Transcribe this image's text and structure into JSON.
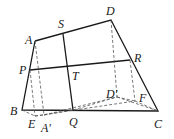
{
  "diagram": {
    "type": "geometry-figure",
    "points": {
      "A": {
        "label": "A",
        "x": 35,
        "y": 41,
        "lx": 25,
        "ly": 44
      },
      "S": {
        "label": "S",
        "x": 63,
        "y": 34,
        "lx": 58,
        "ly": 28
      },
      "D": {
        "label": "D",
        "x": 111,
        "y": 20,
        "lx": 106,
        "ly": 15
      },
      "P": {
        "label": "P",
        "x": 30,
        "y": 70,
        "lx": 19,
        "ly": 74
      },
      "T": {
        "label": "T",
        "x": 68,
        "y": 69,
        "lx": 72,
        "ly": 80
      },
      "R": {
        "label": "R",
        "x": 130,
        "y": 60,
        "lx": 134,
        "ly": 62
      },
      "B": {
        "label": "B",
        "x": 22,
        "y": 110,
        "lx": 10,
        "ly": 115
      },
      "Q": {
        "label": "Q",
        "x": 73,
        "y": 110,
        "lx": 69,
        "ly": 126
      },
      "C": {
        "label": "C",
        "x": 158,
        "y": 111,
        "lx": 154,
        "ly": 128
      },
      "E": {
        "label": "E",
        "x": 35,
        "y": 116,
        "lx": 28,
        "ly": 128
      },
      "A1": {
        "label": "A'",
        "x": 44,
        "y": 115,
        "lx": 41,
        "ly": 132
      },
      "D1": {
        "label": "D'",
        "x": 117,
        "y": 97,
        "lx": 106,
        "ly": 98
      },
      "F": {
        "label": "F",
        "x": 135,
        "y": 101,
        "lx": 139,
        "ly": 102
      }
    }
  }
}
